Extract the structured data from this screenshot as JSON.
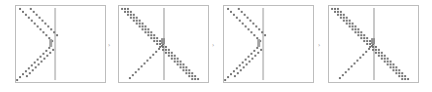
{
  "figure": {
    "colors": {
      "frame": "#bdbdbd",
      "barrier": "#c8c8c8",
      "dots": "#707070"
    },
    "separator_glyph": "›",
    "panels": [
      {
        "id": 1,
        "pattern": "reflect",
        "stripes": 2,
        "transmitted": false
      },
      {
        "id": 2,
        "pattern": "pass-through",
        "stripes": 3,
        "transmitted": true
      },
      {
        "id": 3,
        "pattern": "reflect",
        "stripes": 2,
        "transmitted": false
      },
      {
        "id": 4,
        "pattern": "pass-through",
        "stripes": 3,
        "transmitted": true
      }
    ]
  }
}
